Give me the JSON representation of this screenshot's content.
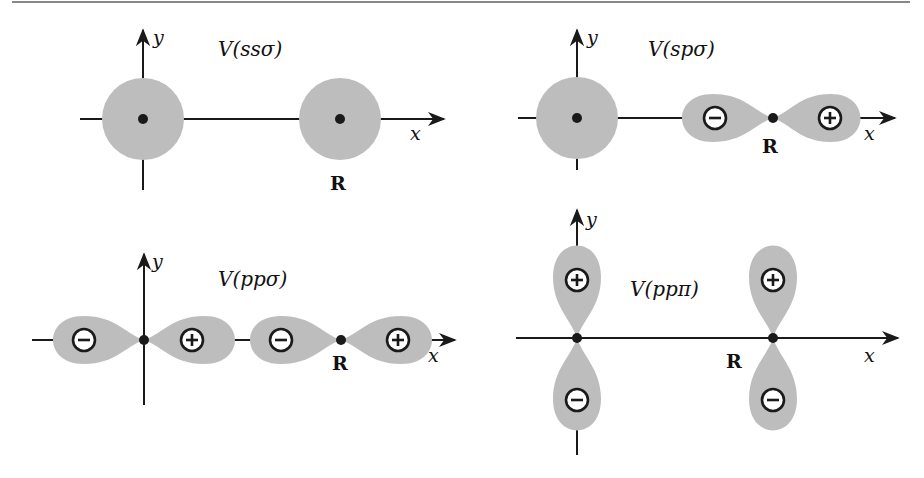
{
  "colors": {
    "orbital_fill": "#bdbdbd",
    "line": "#1a1a1a",
    "top_rule": "#888888",
    "sign_bg": "#ffffff"
  },
  "axes": {
    "x_label": "x",
    "y_label": "y"
  },
  "position_label": "R",
  "panels": [
    {
      "id": "ss-sigma",
      "title": "V(ssσ)",
      "orbital_at_origin": "s",
      "orbital_at_R": "s"
    },
    {
      "id": "sp-sigma",
      "title": "V(spσ)",
      "orbital_at_origin": "s",
      "orbital_at_R": "p_x",
      "signs_at_R": [
        "−",
        "+"
      ]
    },
    {
      "id": "pp-sigma",
      "title": "V(ppσ)",
      "orbital_at_origin": "p_x",
      "orbital_at_R": "p_x",
      "signs_at_origin": [
        "−",
        "+"
      ],
      "signs_at_R": [
        "−",
        "+"
      ]
    },
    {
      "id": "pp-pi",
      "title": "V(ppπ)",
      "orbital_at_origin": "p_y",
      "orbital_at_R": "p_y",
      "signs_at_origin": [
        "+",
        "−"
      ],
      "signs_at_R": [
        "+",
        "−"
      ]
    }
  ]
}
